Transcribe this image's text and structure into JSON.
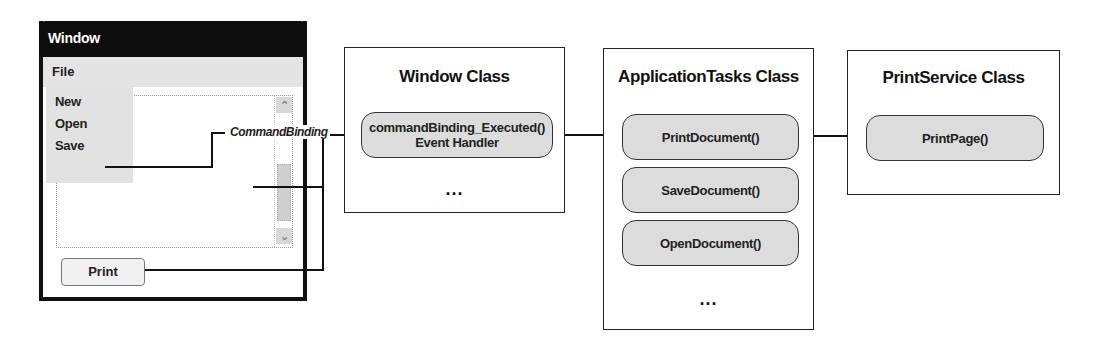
{
  "window_mock": {
    "title": "Window",
    "menu": "File",
    "menu_items": [
      "New",
      "Open",
      "Save"
    ],
    "button_label": "Print"
  },
  "connector_label": "CommandBinding",
  "window_class": {
    "title": "Window Class",
    "handler_line1": "commandBinding_Executed()",
    "handler_line2": "Event Handler",
    "ellipsis": "..."
  },
  "app_tasks_class": {
    "title": "ApplicationTasks Class",
    "methods": [
      "PrintDocument()",
      "SaveDocument()",
      "OpenDocument()"
    ],
    "ellipsis": "..."
  },
  "print_service_class": {
    "title": "PrintService Class",
    "methods": [
      "PrintPage()"
    ]
  },
  "colors": {
    "line": "#111111",
    "pill_fill": "#dcdcdc",
    "title_bar": "#0d0d0d"
  }
}
